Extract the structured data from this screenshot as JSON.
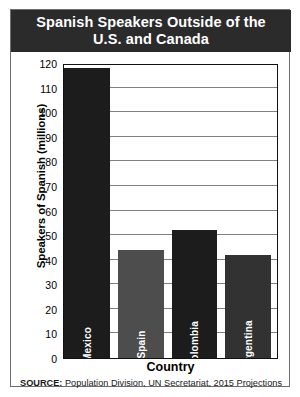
{
  "card": {
    "title_line1": "Spanish Speakers Outside of the",
    "title_line2": "U.S. and Canada"
  },
  "source": {
    "label": "SOURCE:",
    "text": "Population Division, UN Secretariat, 2015 Projections"
  },
  "chart_data": {
    "type": "bar",
    "title": "Spanish Speakers Outside of the U.S. and Canada",
    "categories": [
      "Mexico",
      "Spain",
      "Colombia",
      "Argentina"
    ],
    "values": [
      118,
      44,
      52,
      42
    ],
    "xlabel": "Country",
    "ylabel": "Speakers of Spanish (millions)",
    "ylim": [
      0,
      120
    ],
    "yticks": [
      0,
      10,
      20,
      30,
      40,
      50,
      60,
      70,
      80,
      90,
      100,
      110,
      120
    ],
    "ytick_labels": [
      "0",
      "10",
      "20",
      "30",
      "40",
      "50",
      "60",
      "70",
      "80",
      "90",
      "100",
      "110",
      "120"
    ],
    "grid": true,
    "grid_axis": "y",
    "legend": false,
    "bar_colors": [
      "#1c1c1c",
      "#4d4d4d",
      "#1c1c1c",
      "#323232"
    ],
    "label_color": "#ffffff",
    "gridline_color": "#808080",
    "frame_color": "#111111",
    "banner_color": "#2b2b2b"
  }
}
